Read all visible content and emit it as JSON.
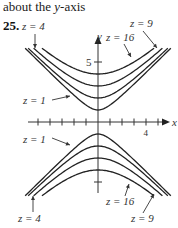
{
  "header": {
    "caption_prefix": "about the ",
    "caption_var": "y",
    "caption_suffix": "-axis",
    "problem_number": "25."
  },
  "chart_data": {
    "type": "line",
    "xlabel": "x",
    "ylabel": "y",
    "x_ticks": [
      -5,
      -4,
      -3,
      -2,
      -1,
      1,
      2,
      3,
      4,
      5
    ],
    "x_tick_labels": [
      {
        "value": 4,
        "label": "4"
      }
    ],
    "y_ticks": [
      5,
      -5
    ],
    "y_tick_labels": [
      {
        "value": 5,
        "label": "5"
      }
    ],
    "xlim": [
      -6,
      6
    ],
    "ylim": [
      -6,
      6
    ],
    "grid": false,
    "levels": [
      1,
      4,
      9,
      16
    ],
    "series": [
      {
        "name": "z = 1",
        "equation": "y^2 - x^2 = 1",
        "vertex_y": 1
      },
      {
        "name": "z = 4",
        "equation": "y^2 - x^2 = 4",
        "vertex_y": 2
      },
      {
        "name": "z = 9",
        "equation": "y^2 - x^2 = 9",
        "vertex_y": 3
      },
      {
        "name": "z = 16",
        "equation": "y^2 - x^2 = 16",
        "vertex_y": 4
      }
    ],
    "annotations": [
      {
        "text": "z = 4",
        "branch": "upper",
        "side": "left"
      },
      {
        "text": "z = 9",
        "branch": "upper",
        "side": "right"
      },
      {
        "text": "z = 16",
        "branch": "upper",
        "side": "right"
      },
      {
        "text": "z = 1",
        "branch": "upper",
        "side": "left"
      },
      {
        "text": "z = 1",
        "branch": "lower",
        "side": "left"
      },
      {
        "text": "z = 4",
        "branch": "lower",
        "side": "left"
      },
      {
        "text": "z = 16",
        "branch": "lower",
        "side": "right"
      },
      {
        "text": "z = 9",
        "branch": "lower",
        "side": "right"
      }
    ]
  }
}
